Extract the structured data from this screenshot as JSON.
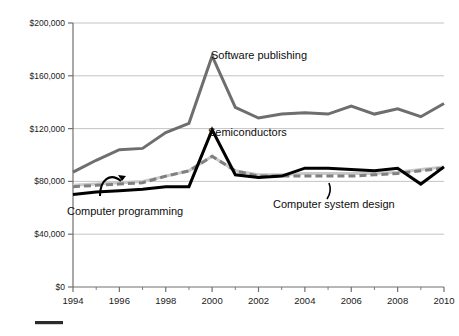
{
  "chart_data": {
    "type": "line",
    "title": "",
    "subtitle": "",
    "xlabel": "",
    "ylabel": "",
    "xlim": [
      1994,
      2010
    ],
    "ylim": [
      0,
      200000
    ],
    "grid": true,
    "legend_position": "inline-annotations",
    "y_tick_labels": [
      "$200,000",
      "$160,000",
      "$120,000",
      "$80,000",
      "$40,000",
      "$0"
    ],
    "y_tick_values": [
      200000,
      160000,
      120000,
      80000,
      40000,
      0
    ],
    "x_tick_labels": [
      "1994",
      "1996",
      "1998",
      "2000",
      "2002",
      "2004",
      "2006",
      "2008",
      "2010"
    ],
    "x_tick_values": [
      1994,
      1996,
      1998,
      2000,
      2002,
      2004,
      2006,
      2008,
      2010
    ],
    "x": [
      1994,
      1995,
      1996,
      1997,
      1998,
      1999,
      2000,
      2001,
      2002,
      2003,
      2004,
      2005,
      2006,
      2007,
      2008,
      2009,
      2010
    ],
    "series": [
      {
        "name": "Software publishing",
        "label": "Software publishing",
        "color": "#6e6e6e",
        "style": "solid",
        "width": 3.0,
        "values": [
          87000,
          96000,
          104000,
          105000,
          117000,
          124000,
          175000,
          136000,
          128000,
          131000,
          132000,
          131000,
          137000,
          131000,
          135000,
          129000,
          139000
        ]
      },
      {
        "name": "Semiconductors",
        "label": "Semiconductors",
        "color": "#000000",
        "style": "solid",
        "width": 3.0,
        "values": [
          70000,
          72000,
          73000,
          74000,
          76000,
          76000,
          119000,
          85000,
          83000,
          84000,
          90000,
          90000,
          89000,
          88000,
          90000,
          78000,
          91000
        ]
      },
      {
        "name": "Computer system design",
        "label": "Computer system design",
        "color": "#808080",
        "style": "dashed",
        "width": 3.0,
        "values": [
          76000,
          77000,
          78000,
          79000,
          84000,
          88000,
          99000,
          88000,
          84000,
          84000,
          84000,
          84000,
          84000,
          85000,
          86000,
          88000,
          90000
        ]
      },
      {
        "name": "Computer programming",
        "label": "Computer programming",
        "color": "#c9c9c9",
        "style": "solid",
        "width": 3.0,
        "values": [
          77000,
          78000,
          79000,
          80000,
          84000,
          88000,
          99000,
          88000,
          85000,
          85000,
          86000,
          86000,
          86000,
          86000,
          87000,
          89000,
          91000
        ]
      }
    ],
    "annotations": [
      {
        "name": "software-publishing-label",
        "text": "Software publishing",
        "x": 211,
        "y": 59
      },
      {
        "name": "semiconductors-label",
        "text": "Semiconductors",
        "x": 208,
        "y": 136
      },
      {
        "name": "computer-programming-label",
        "text": "Computer programming",
        "x": 67,
        "y": 215
      },
      {
        "name": "computer-system-design-label",
        "text": "Computer system design",
        "x": 273,
        "y": 208
      }
    ]
  },
  "footer": {
    "rule_color": "#2b2b2b"
  }
}
